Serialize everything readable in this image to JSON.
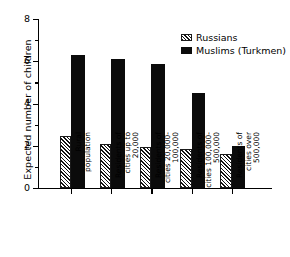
{
  "chart_data": {
    "type": "bar",
    "title": "",
    "xlabel": "",
    "ylabel": "Expected number of children",
    "ylim": [
      0,
      8
    ],
    "yticks": [
      0,
      2,
      4,
      6,
      8
    ],
    "ytick_labels": [
      "0",
      "2",
      "4",
      "6",
      "8"
    ],
    "grid": false,
    "legend_position": "top-right",
    "categories": [
      "Rural\npopulation",
      "Residents of\ncities up to\n20,000",
      "Residents of\ncities 20,000-\n100,000",
      "Residents of\ncities 100,000-\n500,000",
      "Residents of\ncities over\n500,000"
    ],
    "series": [
      {
        "name": "Russians",
        "fill": "hatched",
        "values": [
          2.45,
          2.1,
          1.95,
          1.85,
          1.6
        ]
      },
      {
        "name": "Muslims (Turkmen)",
        "fill": "solid",
        "values": [
          6.3,
          6.1,
          5.85,
          4.5,
          2.0
        ]
      }
    ]
  },
  "legend": {
    "items": [
      {
        "label": "Russians",
        "fill": "hatched"
      },
      {
        "label": "Muslims (Turkmen)",
        "fill": "solid"
      }
    ]
  },
  "colors": {
    "solid": "#0b0b0b",
    "hatch_line": "#121212",
    "background": "#ffffff",
    "axis": "#000000"
  }
}
